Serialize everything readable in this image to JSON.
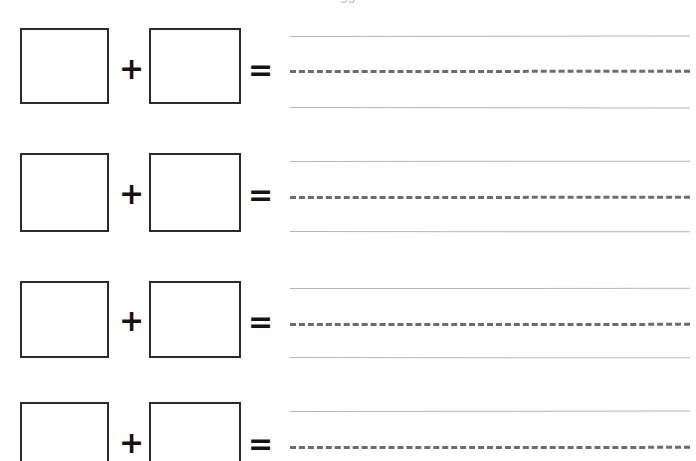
{
  "page": {
    "title_cut_off": "gg",
    "background_color": "#ffffff",
    "width": 696,
    "height": 461
  },
  "worksheet": {
    "type": "addition-with-answer-writing-lines",
    "problem_count": 4,
    "operators": {
      "plus": "+",
      "equals": "="
    },
    "box_fill_color": "#ffffff",
    "box_border_color": "#2b2b2b",
    "guide_solid_color": "#b4b6ba",
    "guide_dashed_color": "#6a6c70",
    "problems": [
      {
        "index": 1,
        "addend_a": "",
        "addend_b": "",
        "answer": "",
        "plus": "+",
        "equals": "="
      },
      {
        "index": 2,
        "addend_a": "",
        "addend_b": "",
        "answer": "",
        "plus": "+",
        "equals": "="
      },
      {
        "index": 3,
        "addend_a": "",
        "addend_b": "",
        "answer": "",
        "plus": "+",
        "equals": "="
      },
      {
        "index": 4,
        "addend_a": "",
        "addend_b": "",
        "answer": "",
        "plus": "+",
        "equals": "="
      }
    ]
  },
  "geometry": {
    "rows": [
      {
        "box_top": 28,
        "box_height": 76,
        "plus_top": 54,
        "plus_left": 119,
        "eq_top": 55,
        "eq_left": 248,
        "line_top": 36,
        "line_mid": 70,
        "line_bot": 107,
        "slope_top": -0.6,
        "slope_mid": -0.3,
        "slope_bot": 0.6
      },
      {
        "box_top": 153,
        "box_height": 79,
        "plus_top": 179,
        "plus_left": 119,
        "eq_top": 180,
        "eq_left": 248,
        "line_top": 161,
        "line_mid": 196,
        "line_bot": 231,
        "slope_top": -0.4,
        "slope_mid": -0.3,
        "slope_bot": 0.5
      },
      {
        "box_top": 281,
        "box_height": 77,
        "plus_top": 306,
        "plus_left": 119,
        "eq_top": 307,
        "eq_left": 248,
        "line_top": 288,
        "line_mid": 323,
        "line_bot": 357,
        "slope_top": -0.3,
        "slope_mid": -0.2,
        "slope_bot": 0.4
      },
      {
        "box_top": 402,
        "box_height": 79,
        "plus_top": 428,
        "plus_left": 119,
        "eq_top": 429,
        "eq_left": 248,
        "line_top": 411,
        "line_mid": 446,
        "line_bot": 481,
        "slope_top": -0.6,
        "slope_mid": -0.2,
        "slope_bot": 0.4
      }
    ]
  }
}
